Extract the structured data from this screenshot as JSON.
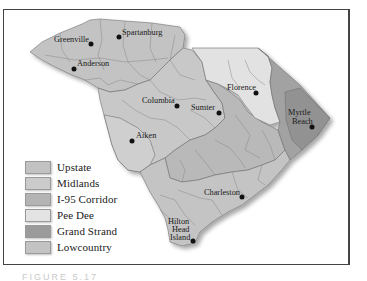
{
  "map": {
    "title": "South Carolina Tourism Regions",
    "colors": {
      "upstate": "#c4c4c4",
      "midlands": "#c9c9c9",
      "i95": "#bababa",
      "peedee": "#e2e2e2",
      "grandstrand": "#9f9f9f",
      "lowcountry": "#c6c6c6",
      "border": "#6f6f6f"
    },
    "cities": [
      {
        "name": "Greenville",
        "line1": "Greenville",
        "line2": ""
      },
      {
        "name": "Spartanburg",
        "line1": "Spartanburg",
        "line2": ""
      },
      {
        "name": "Anderson",
        "line1": "Anderson",
        "line2": ""
      },
      {
        "name": "Columbia",
        "line1": "Columbia",
        "line2": ""
      },
      {
        "name": "Sumter",
        "line1": "Sumter",
        "line2": ""
      },
      {
        "name": "Florence",
        "line1": "Florence",
        "line2": ""
      },
      {
        "name": "Myrtle Beach",
        "line1": "Myrtle",
        "line2": "Beach"
      },
      {
        "name": "Aiken",
        "line1": "Aiken",
        "line2": ""
      },
      {
        "name": "Charleston",
        "line1": "Charleston",
        "line2": ""
      },
      {
        "name": "Hilton Head Island",
        "line1": "Hilton",
        "line2": "Head",
        "line3": "Island"
      }
    ]
  },
  "legend": {
    "items": [
      {
        "label": "Upstate",
        "color": "#c2c2c2"
      },
      {
        "label": "Midlands",
        "color": "#cbcbcb"
      },
      {
        "label": "I-95 Corridor",
        "color": "#b4b4b4"
      },
      {
        "label": "Pee Dee",
        "color": "#e3e3e3"
      },
      {
        "label": "Grand Strand",
        "color": "#9b9b9b"
      },
      {
        "label": "Lowcountry",
        "color": "#c3c3c3"
      }
    ]
  },
  "caption": "FIGURE 5.17"
}
